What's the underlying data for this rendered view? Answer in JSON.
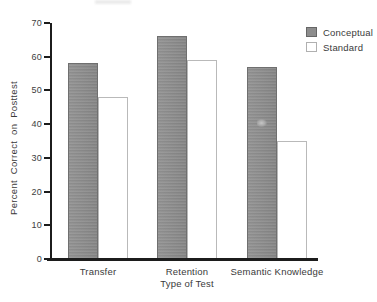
{
  "figure": {
    "background": "#ffffff",
    "axis_color": "#1c1c1c",
    "text_color": "#3a3a3a"
  },
  "chart_data": {
    "type": "bar",
    "title": "",
    "xlabel": "Type of Test",
    "ylabel": "Percent Correct on Posttest",
    "categories": [
      "Transfer",
      "Retention",
      "Semantic Knowledge"
    ],
    "series": [
      {
        "name": "Conceptual",
        "values": [
          58,
          66,
          57
        ],
        "fill": "#8d8d8d",
        "border": "#6f6f6f"
      },
      {
        "name": "Standard",
        "values": [
          48,
          59,
          35
        ],
        "fill": "#ffffff",
        "border": "#b9b9b9"
      }
    ],
    "ylim": [
      0,
      70
    ],
    "yticks": [
      0,
      10,
      20,
      30,
      40,
      50,
      60,
      70
    ],
    "grid": false,
    "legend_position": "top-right"
  }
}
